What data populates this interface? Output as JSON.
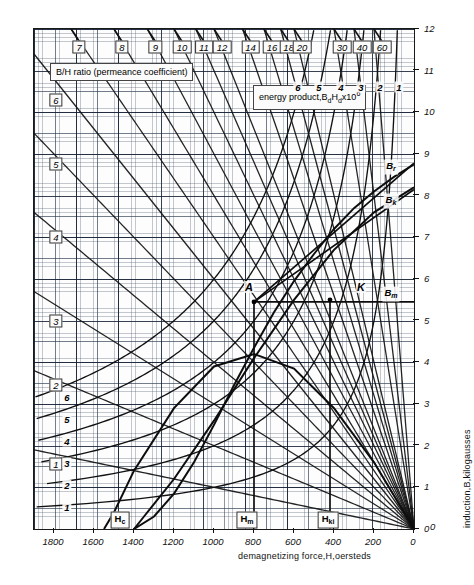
{
  "chart_data": {
    "type": "line",
    "title": "",
    "xlabel": "demagnetizing force,H,oersteds",
    "ylabel": "induction,B,kilogausses",
    "xlim": [
      1900,
      0
    ],
    "ylim": [
      0,
      12
    ],
    "grid": "graph-paper, 10x10 fine subdivisions per major division",
    "x_ticks": [
      "1800",
      "1600",
      "1400",
      "1200",
      "1000",
      "800",
      "600",
      "400",
      "200",
      "0"
    ],
    "x_tick_values": [
      1800,
      1600,
      1400,
      1200,
      1000,
      800,
      600,
      400,
      200,
      0
    ],
    "y_ticks": [
      "0",
      "1",
      "2",
      "3",
      "4",
      "5",
      "6",
      "7",
      "8",
      "9",
      "10",
      "11",
      "12"
    ],
    "y_tick_values": [
      0,
      1,
      2,
      3,
      4,
      5,
      6,
      7,
      8,
      9,
      10,
      11,
      12
    ],
    "banners": [
      {
        "text": "B/H ratio (permeance coefficient)",
        "box": true
      },
      {
        "text": "energy product,BdHdx10^6",
        "box": true
      }
    ],
    "series": [
      {
        "name": "demagnetization-curve",
        "kind": "normal-demagnetization",
        "note": "main B-H demagnetization curve from Br to Hc",
        "points": [
          [
            0,
            8.75
          ],
          [
            100,
            8.45
          ],
          [
            200,
            8.1
          ],
          [
            300,
            7.7
          ],
          [
            400,
            7.2
          ],
          [
            500,
            6.6
          ],
          [
            600,
            5.95
          ],
          [
            700,
            5.2
          ],
          [
            800,
            4.35
          ],
          [
            900,
            3.45
          ],
          [
            1000,
            2.5
          ],
          [
            1100,
            1.6
          ],
          [
            1200,
            0.85
          ],
          [
            1300,
            0.3
          ],
          [
            1400,
            0.0
          ]
        ]
      },
      {
        "name": "intrinsic-curve",
        "kind": "intrinsic-demagnetization",
        "points": [
          [
            0,
            8.2
          ],
          [
            200,
            7.6
          ],
          [
            400,
            6.7
          ],
          [
            600,
            5.5
          ],
          [
            800,
            4.1
          ],
          [
            1000,
            2.6
          ],
          [
            1200,
            1.2
          ],
          [
            1350,
            0.3
          ],
          [
            1400,
            0.0
          ]
        ]
      },
      {
        "name": "energy-product-curve",
        "kind": "BdHd-product",
        "note": "energy product vs B, peaks near 4.2x10^6",
        "points": [
          [
            0,
            0
          ],
          [
            200,
            1.6
          ],
          [
            400,
            2.9
          ],
          [
            600,
            3.85
          ],
          [
            800,
            4.2
          ],
          [
            1000,
            3.9
          ],
          [
            1200,
            2.9
          ],
          [
            1400,
            1.4
          ],
          [
            1500,
            0.4
          ],
          [
            1550,
            0.0
          ]
        ]
      }
    ],
    "hyperbolas": {
      "label": "energy product hyperbolas BdHd = const",
      "constants": [
        1,
        2,
        3,
        4,
        5,
        6
      ],
      "left_labels": [
        "6",
        "5",
        "4",
        "3",
        "2",
        "1"
      ]
    },
    "permeance_lines": {
      "label": "B/H ratio rays through origin",
      "top_labels": [
        "7",
        "8",
        "9",
        "10",
        "11",
        "12",
        "14",
        "16",
        "18",
        "20",
        "30",
        "40",
        "60"
      ],
      "top_values": [
        7,
        8,
        9,
        10,
        11,
        12,
        14,
        16,
        18,
        20,
        30,
        40,
        60
      ],
      "left_labels": [
        "6",
        "5",
        "4",
        "3",
        "2",
        "1"
      ],
      "left_values": [
        6,
        5,
        4,
        3,
        2,
        1
      ]
    },
    "energy_product_top_labels": [
      "6",
      "5",
      "4",
      "3",
      "2",
      "1"
    ],
    "annotations": [
      {
        "name": "point-A",
        "text": "A",
        "x": 800,
        "y": 5.45
      },
      {
        "name": "point-K",
        "text": "K",
        "x": 420,
        "y": 5.5
      },
      {
        "name": "Br",
        "text": "Br",
        "x": 95,
        "y": 8.78
      },
      {
        "name": "Bk",
        "text": "Bk",
        "x": 95,
        "y": 8.15
      },
      {
        "name": "Bm",
        "text": "Bm",
        "x": 130,
        "y": 5.45
      },
      {
        "name": "Hc",
        "text": "Hc",
        "x": 1400,
        "y": 0.12
      },
      {
        "name": "Hm",
        "text": "Hm",
        "x": 800,
        "y": 0.12
      },
      {
        "name": "Hki",
        "text": "Hki",
        "x": 420,
        "y": 0.12
      }
    ]
  },
  "axes": {
    "x_title": "demagnetizing force,H,oersteds",
    "y_title": "induction,B,kilogausses",
    "x_labels": [
      "1800",
      "1600",
      "1400",
      "1200",
      "1000",
      "800",
      "600",
      "400",
      "200",
      "0"
    ],
    "y_labels": [
      "0",
      "1",
      "2",
      "3",
      "4",
      "5",
      "6",
      "7",
      "8",
      "9",
      "10",
      "11",
      "12"
    ],
    "origin_label": "0"
  },
  "legends": {
    "bh_ratio_banner": "B/H ratio (permeance coefficient)",
    "energy_product_banner_pre": "energy product,B",
    "energy_product_banner_sub1": "d",
    "energy_product_banner_mid": "H",
    "energy_product_banner_sub2": "d",
    "energy_product_banner_post": "x10",
    "energy_product_banner_sup": "6"
  },
  "top_bh_labels": [
    {
      "text": "7",
      "x": 7
    },
    {
      "text": "8",
      "x": 8
    },
    {
      "text": "9",
      "x": 9
    },
    {
      "text": "10",
      "x": 10
    },
    {
      "text": "11",
      "x": 11
    },
    {
      "text": "12",
      "x": 12
    },
    {
      "text": "14",
      "x": 14
    },
    {
      "text": "16",
      "x": 16
    },
    {
      "text": "18",
      "x": 18
    },
    {
      "text": "20",
      "x": 20
    },
    {
      "text": "30",
      "x": 30
    },
    {
      "text": "40",
      "x": 40
    },
    {
      "text": "60",
      "x": 60
    }
  ],
  "left_bh_labels": [
    {
      "text": "6"
    },
    {
      "text": "5"
    },
    {
      "text": "4"
    },
    {
      "text": "3"
    },
    {
      "text": "2"
    },
    {
      "text": "1"
    }
  ],
  "energy_left_labels": [
    {
      "text": "6"
    },
    {
      "text": "5"
    },
    {
      "text": "4"
    },
    {
      "text": "3"
    },
    {
      "text": "2"
    },
    {
      "text": "1"
    }
  ],
  "energy_top_labels": [
    {
      "text": "6"
    },
    {
      "text": "5"
    },
    {
      "text": "4"
    },
    {
      "text": "3"
    },
    {
      "text": "2"
    },
    {
      "text": "1"
    }
  ],
  "points": {
    "A": "A",
    "K": "K",
    "Br_pre": "B",
    "Br_sub": "r",
    "Bk_pre": "B",
    "Bk_sub": "k",
    "Bm_pre": "B",
    "Bm_sub": "m",
    "Hc_pre": "H",
    "Hc_sub": "c",
    "Hm_pre": "H",
    "Hm_sub": "m",
    "Hki_pre": "H",
    "Hki_sub": "ki"
  },
  "colors": {
    "ink": "#111111",
    "grid_fine": "#6f7f96",
    "grid_major": "#243352",
    "paper": "#fdfdfd"
  }
}
